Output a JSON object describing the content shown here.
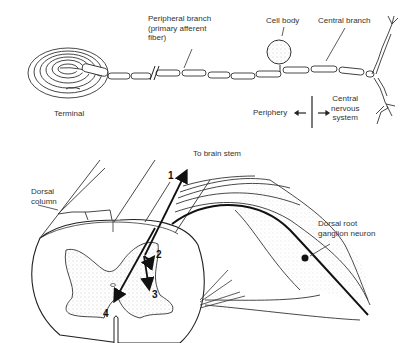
{
  "top_panel": {
    "labels": {
      "peripheral_branch": "Peripheral branch\n(primary afferent\nfiber)",
      "cell_body": "Cell body",
      "central_branch": "Central branch",
      "terminal": "Terminal",
      "periphery": "Periphery",
      "cns": "Central\nnervous\nsystem"
    }
  },
  "bottom_panel": {
    "labels": {
      "to_brain_stem": "To brain stem",
      "dorsal_column": "Dorsal\ncolumn",
      "drg_neuron": "Dorsal root\nganglion neuron"
    },
    "pathway_numbers": [
      "1",
      "2",
      "3",
      "4"
    ]
  }
}
